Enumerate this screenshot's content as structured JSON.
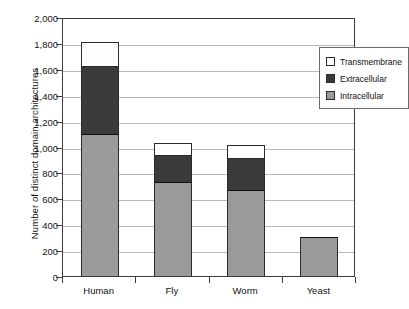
{
  "chart_data": {
    "type": "bar",
    "subtype": "stacked-bar",
    "title": "",
    "xlabel": "",
    "ylabel": "Number of distinct domain architectures",
    "ylim": [
      0,
      2000
    ],
    "ytick_step": 200,
    "ytick_labels": [
      "0",
      "200",
      "400",
      "600",
      "800",
      "1,000",
      "1,200",
      "1,400",
      "1,600",
      "1,800",
      "2,000"
    ],
    "ytick_values": [
      0,
      200,
      400,
      600,
      800,
      1000,
      1200,
      1400,
      1600,
      1800,
      2000
    ],
    "grid": true,
    "grid_axis": "y",
    "legend_position": "top-right",
    "categories": [
      "Human",
      "Fly",
      "Worm",
      "Yeast"
    ],
    "series": [
      {
        "name": "Intracellular",
        "color": "#9a9a9a",
        "values": [
          1090,
          715,
          655,
          295
        ]
      },
      {
        "name": "Extracellular",
        "color": "#3a3a3a",
        "values": [
          525,
          215,
          245,
          5
        ]
      },
      {
        "name": "Transmembrane",
        "color": "#fdfdfd",
        "values": [
          195,
          100,
          115,
          0
        ]
      }
    ],
    "totals": [
      1810,
      1030,
      1015,
      300
    ]
  },
  "legend": {
    "items": [
      {
        "label": "Transmembrane",
        "color": "#fdfdfd"
      },
      {
        "label": "Extracellular",
        "color": "#3a3a3a"
      },
      {
        "label": "Intracellular",
        "color": "#9a9a9a"
      }
    ]
  }
}
